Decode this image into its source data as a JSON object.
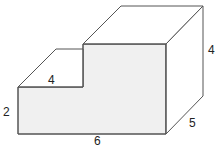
{
  "diagram": {
    "type": "3d-step-prism",
    "labels": {
      "step_height": "2",
      "step_depth_top": "4",
      "base_width": "6",
      "depth": "5",
      "tall_height": "4"
    },
    "colors": {
      "front_face": "#f0f0f0",
      "edge": "#555555",
      "label": "#222222"
    }
  }
}
